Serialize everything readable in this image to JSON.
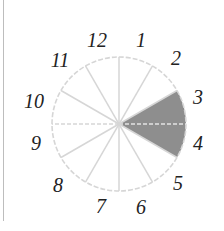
{
  "diagram": {
    "type": "clock-sector-circle",
    "center": [
      119,
      124
    ],
    "radius": 67,
    "label_radius": 90,
    "sectors": 12,
    "labels": [
      "12",
      "1",
      "2",
      "3",
      "4",
      "5",
      "6",
      "7",
      "8",
      "9",
      "10",
      "11"
    ],
    "label_positions": [
      {
        "text": "12",
        "x": 97,
        "y": 47
      },
      {
        "text": "1",
        "x": 141,
        "y": 47
      },
      {
        "text": "2",
        "x": 176,
        "y": 65
      },
      {
        "text": "3",
        "x": 198,
        "y": 104
      },
      {
        "text": "4",
        "x": 198,
        "y": 150
      },
      {
        "text": "5",
        "x": 178,
        "y": 190
      },
      {
        "text": "6",
        "x": 141,
        "y": 214
      },
      {
        "text": "7",
        "x": 101,
        "y": 213
      },
      {
        "text": "8",
        "x": 58,
        "y": 192
      },
      {
        "text": "9",
        "x": 36,
        "y": 150
      },
      {
        "text": "10",
        "x": 34,
        "y": 108
      },
      {
        "text": "11",
        "x": 60,
        "y": 67
      }
    ],
    "shaded_sectors": [
      "3",
      "4"
    ],
    "shaded_angle_range_deg": [
      -30,
      30
    ],
    "colors": {
      "grid": "#d6d6d6",
      "shade": "#8e8e8e",
      "label": "#222222",
      "border": "#bdbdbd"
    }
  }
}
